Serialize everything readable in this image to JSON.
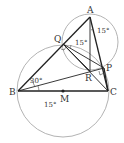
{
  "diagram": {
    "points": {
      "A": {
        "label": "A",
        "x": 90,
        "y": 17
      },
      "B": {
        "label": "B",
        "x": 18,
        "y": 91
      },
      "C": {
        "label": "C",
        "x": 108,
        "y": 91
      },
      "M": {
        "label": "M",
        "x": 63,
        "y": 91
      },
      "P": {
        "label": "P",
        "x": 104,
        "y": 68
      },
      "Q": {
        "label": "Q",
        "x": 63,
        "y": 44
      },
      "R": {
        "label": "R",
        "x": 90,
        "y": 71
      }
    },
    "angles": {
      "a_at_A": "15°",
      "a_at_Q": "15°",
      "a_at_B_upper": "30°",
      "a_at_B_lower": "15°"
    },
    "colors": {
      "stroke": "#222222",
      "circle": "#999999",
      "background": "#ffffff"
    }
  }
}
